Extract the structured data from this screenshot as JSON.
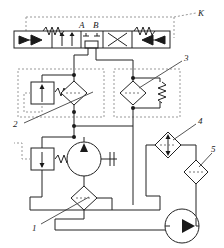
{
  "diagram": {
    "background": "#ffffff",
    "line_color": "#222222",
    "dash_color": "#999999",
    "stroke_width": 1
  },
  "labels": {
    "port_a": "A",
    "port_b": "B",
    "callout_k": "K",
    "callout_1": "1",
    "callout_2": "2",
    "callout_3": "3",
    "callout_4": "4",
    "callout_5": "5"
  },
  "components": [
    {
      "id": "directional-valve",
      "name": "4/3 directional control valve",
      "label": "",
      "positions": 4,
      "ports": [
        "A",
        "B"
      ]
    },
    {
      "id": "relief-valve-left",
      "name": "pressure relief valve (left)",
      "label": ""
    },
    {
      "id": "filter-left",
      "name": "filter / check element (left)",
      "label": ""
    },
    {
      "id": "filter-right",
      "name": "filter / check element (right)",
      "label": "3"
    },
    {
      "id": "spring-right",
      "name": "spring accumulator (right)",
      "label": ""
    },
    {
      "id": "relief-valve-lower",
      "name": "pressure relief valve (lower)",
      "label": "2"
    },
    {
      "id": "hydraulic-motor",
      "name": "hydraulic motor with shaft",
      "label": ""
    },
    {
      "id": "filter-bottom",
      "name": "filter (bottom)",
      "label": "1"
    },
    {
      "id": "filter-four",
      "name": "bidirectional filter / cooler",
      "label": "4"
    },
    {
      "id": "filter-five",
      "name": "filter (right lower)",
      "label": "5"
    },
    {
      "id": "pump",
      "name": "hydraulic pump",
      "label": ""
    }
  ]
}
